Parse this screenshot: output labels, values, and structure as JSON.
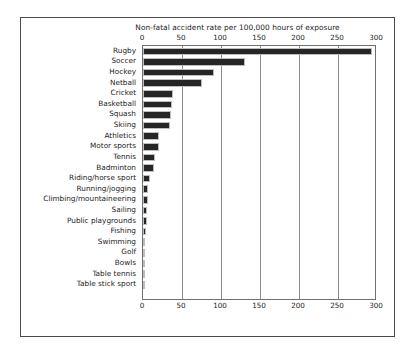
{
  "chart_data": {
    "type": "bar",
    "orientation": "horizontal",
    "title": "Non-fatal accident rate per 100,000 hours of exposure",
    "xlabel": "",
    "ylabel": "",
    "xlim": [
      0,
      300
    ],
    "xticks": [
      0,
      50,
      100,
      150,
      200,
      250,
      300
    ],
    "xtick_labels": [
      "0",
      "50",
      "100",
      "150",
      "200",
      "250",
      "300"
    ],
    "axis_positions": [
      "top",
      "bottom"
    ],
    "grid": true,
    "legend": false,
    "bar_color": "#262626",
    "categories": [
      "Rugby",
      "Soccer",
      "Hockey",
      "Netball",
      "Cricket",
      "Basketball",
      "Squash",
      "Skiing",
      "Athletics",
      "Motor sports",
      "Tennis",
      "Badminton",
      "Riding/horse sport",
      "Running/jogging",
      "Climbing/mountaineering",
      "Sailing",
      "Public playgrounds",
      "Fishing",
      "Swimming",
      "Golf",
      "Bowls",
      "Table tennis",
      "Table stick sport"
    ],
    "values": [
      293,
      131,
      91,
      76,
      38,
      37,
      36,
      35,
      21,
      20,
      15,
      14,
      9,
      7,
      6,
      5,
      5,
      4,
      3,
      3,
      2,
      1,
      1
    ]
  }
}
